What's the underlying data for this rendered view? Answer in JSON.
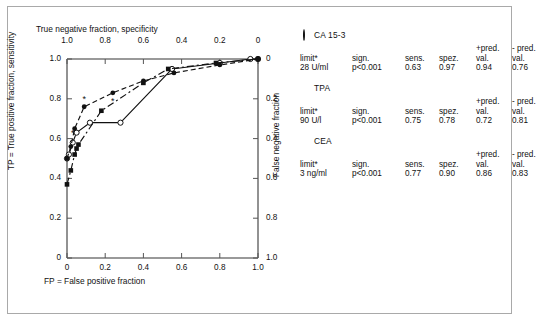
{
  "chart_data": {
    "type": "line",
    "title": "",
    "top_axis_label": "True negative fraction, specificity",
    "top_axis_ticks": [
      "1.0",
      "0.8",
      "0.6",
      "0.4",
      "0.2",
      "0"
    ],
    "left_axis_label": "TP = True positive fraction, sensitivity",
    "left_axis_ticks": [
      "1.0",
      "0.8",
      "0.6",
      "0.4",
      "0.2",
      "0"
    ],
    "bottom_axis_label": "FP = False positive fraction",
    "bottom_axis_ticks": [
      "0",
      "0.2",
      "0.4",
      "0.6",
      "0.8",
      "1.0"
    ],
    "right_axis_label": "False negative fraction",
    "right_axis_ticks": [
      "0",
      "0.2",
      "0.4",
      "0.6",
      "0.8",
      "1.0"
    ],
    "xlim": [
      0,
      1
    ],
    "ylim": [
      0,
      1
    ],
    "grid": false,
    "legend_position": "right",
    "series": [
      {
        "name": "CA 15-3",
        "marker": "open-circle",
        "line_style": "solid",
        "points": [
          [
            0.0,
            0.5
          ],
          [
            0.01,
            0.52
          ],
          [
            0.03,
            0.58
          ],
          [
            0.05,
            0.63
          ],
          [
            0.12,
            0.68
          ],
          [
            0.28,
            0.68
          ],
          [
            0.55,
            0.95
          ],
          [
            0.8,
            0.98
          ],
          [
            0.96,
            1.0
          ],
          [
            1.0,
            1.0
          ]
        ]
      },
      {
        "name": "TPA",
        "marker": "filled-square",
        "line_style": "dash-dot",
        "points": [
          [
            0.0,
            0.37
          ],
          [
            0.02,
            0.44
          ],
          [
            0.04,
            0.52
          ],
          [
            0.05,
            0.55
          ],
          [
            0.06,
            0.57
          ],
          [
            0.18,
            0.74
          ],
          [
            0.4,
            0.88
          ],
          [
            0.53,
            0.95
          ],
          [
            0.78,
            0.98
          ],
          [
            1.0,
            1.0
          ]
        ]
      },
      {
        "name": "CEA",
        "marker": "filled-circle",
        "line_style": "dashed",
        "points": [
          [
            0.0,
            0.5
          ],
          [
            0.02,
            0.56
          ],
          [
            0.04,
            0.65
          ],
          [
            0.09,
            0.76
          ],
          [
            0.24,
            0.83
          ],
          [
            0.4,
            0.89
          ],
          [
            0.56,
            0.93
          ],
          [
            0.8,
            0.97
          ],
          [
            1.0,
            1.0
          ]
        ]
      }
    ],
    "extra_markers": {
      "description": "small asterisk annotations near selected points",
      "points": [
        [
          0.03,
          0.63
        ],
        [
          0.09,
          0.8
        ],
        [
          0.24,
          0.79
        ]
      ]
    }
  },
  "legend": {
    "columns": {
      "limit": "limit*",
      "sign": "sign.",
      "sens": "sens.",
      "spez": "spez.",
      "pred_pos_l1": "+pred.",
      "pred_pos_l2": "val.",
      "pred_neg_l1": "- pred.",
      "pred_neg_l2": "val."
    },
    "entries": [
      {
        "name": "CA 15-3",
        "marker": "open-circle",
        "limit": "28 U/ml",
        "sign": "p<0.001",
        "sens": "0.63",
        "spez": "0.97",
        "pred_pos": "0.94",
        "pred_neg": "0.76"
      },
      {
        "name": "TPA",
        "marker": "filled-square",
        "limit": "90 U/l",
        "sign": "p<0.001",
        "sens": "0.75",
        "spez": "0.78",
        "pred_pos": "0.72",
        "pred_neg": "0.81"
      },
      {
        "name": "CEA",
        "marker": "filled-circle",
        "limit": "3 ng/ml",
        "sign": "p<0.001",
        "sens": "0.77",
        "spez": "0.90",
        "pred_pos": "0.86",
        "pred_neg": "0.83"
      }
    ]
  },
  "colors": {
    "ink": "#111111",
    "frame": "#a9a9a9",
    "background": "#ffffff"
  }
}
